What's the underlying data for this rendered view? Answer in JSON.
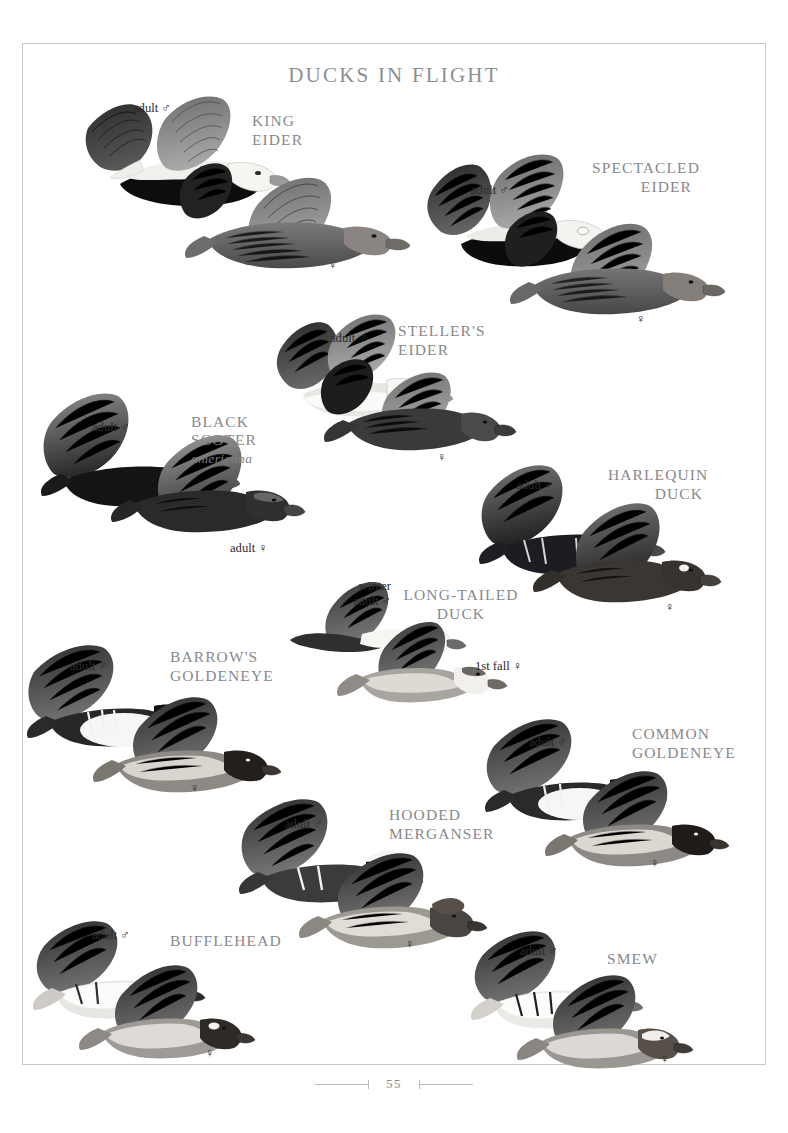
{
  "page": {
    "title": "DUCKS IN FLIGHT",
    "number": "55",
    "border_color": "#c9c9c9",
    "title_color": "#8e8e90",
    "species_color": "#88888c",
    "label_color": "#2d2b29",
    "background": "#ffffff"
  },
  "symbols": {
    "male": "♂",
    "female": "♀"
  },
  "species": [
    {
      "id": "king-eider",
      "name": "KING\nEIDER",
      "align": "align-left",
      "name_x": 252,
      "name_y": 112,
      "labels": [
        {
          "text": "adult ♂",
          "x": 133,
          "y": 101
        },
        {
          "text": "♀",
          "x": 328,
          "y": 258
        }
      ]
    },
    {
      "id": "spectacled-eider",
      "name": "SPECTACLED\nEIDER",
      "align": "align-right",
      "name_x": 592,
      "name_y": 159,
      "name_w": 100,
      "labels": [
        {
          "text": "adult ♂",
          "x": 471,
          "y": 183
        },
        {
          "text": "♀",
          "x": 636,
          "y": 312
        }
      ]
    },
    {
      "id": "stellers-eider",
      "name": "STELLER'S\nEIDER",
      "align": "align-left",
      "name_x": 398,
      "name_y": 322,
      "labels": [
        {
          "text": "adult ♂",
          "x": 330,
          "y": 331
        },
        {
          "text": "♀",
          "x": 437,
          "y": 450
        }
      ]
    },
    {
      "id": "black-scoter",
      "name": "BLACK\nSCOTER",
      "subspecies": "americana",
      "align": "align-left",
      "name_x": 191,
      "name_y": 394,
      "labels": [
        {
          "text": "adult ♂",
          "x": 92,
          "y": 420
        },
        {
          "text": "adult ♀",
          "x": 230,
          "y": 541
        }
      ]
    },
    {
      "id": "harlequin-duck",
      "name": "HARLEQUIN\nDUCK",
      "align": "align-right",
      "name_x": 608,
      "name_y": 466,
      "name_w": 95,
      "labels": [
        {
          "text": "adult ♂",
          "x": 516,
          "y": 478
        },
        {
          "text": "♀",
          "x": 665,
          "y": 600
        }
      ]
    },
    {
      "id": "long-tailed-duck",
      "name": "LONG-TAILED\nDUCK",
      "align": "align-center",
      "name_x": 400,
      "name_y": 586,
      "name_w": 122,
      "labels": [
        {
          "text": "winter\nadult ♂",
          "x": 341,
          "y": 579
        },
        {
          "text": "1st fall ♀",
          "x": 475,
          "y": 659
        }
      ]
    },
    {
      "id": "barrows-goldeneye",
      "name": "BARROW'S\nGOLDENEYE",
      "align": "align-left",
      "name_x": 170,
      "name_y": 648,
      "labels": [
        {
          "text": "adult ♂",
          "x": 70,
          "y": 659
        },
        {
          "text": "♀",
          "x": 190,
          "y": 781
        }
      ]
    },
    {
      "id": "common-goldeneye",
      "name": "COMMON\nGOLDENEYE",
      "align": "align-left",
      "name_x": 632,
      "name_y": 725,
      "labels": [
        {
          "text": "adult ♂",
          "x": 529,
          "y": 735
        },
        {
          "text": "♀",
          "x": 650,
          "y": 856
        }
      ]
    },
    {
      "id": "hooded-merganser",
      "name": "HOODED\nMERGANSER",
      "align": "align-left",
      "name_x": 389,
      "name_y": 806,
      "labels": [
        {
          "text": "adult ♂",
          "x": 285,
          "y": 817
        },
        {
          "text": "♀",
          "x": 405,
          "y": 937
        }
      ]
    },
    {
      "id": "bufflehead",
      "name": "BUFFLEHEAD",
      "align": "align-left",
      "name_x": 170,
      "name_y": 932,
      "labels": [
        {
          "text": "adult ♂",
          "x": 92,
          "y": 928
        },
        {
          "text": "♀",
          "x": 205,
          "y": 1046
        }
      ]
    },
    {
      "id": "smew",
      "name": "SMEW",
      "align": "align-left",
      "name_x": 607,
      "name_y": 950,
      "labels": [
        {
          "text": "adult ♂",
          "x": 520,
          "y": 944
        },
        {
          "text": "♀",
          "x": 660,
          "y": 1052
        }
      ]
    }
  ]
}
